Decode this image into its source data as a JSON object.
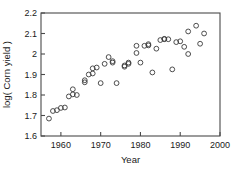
{
  "chart_data": {
    "type": "scatter",
    "title": "",
    "xlabel": "Year",
    "ylabel": "log( Corn yield )",
    "xlim": [
      1955,
      2000
    ],
    "ylim": [
      1.6,
      2.2
    ],
    "xticks": [
      1960,
      1970,
      1980,
      1990,
      2000
    ],
    "xtick_labels": [
      "1960",
      "1970",
      "1980",
      "1990",
      "2000"
    ],
    "yticks": [
      1.6,
      1.7,
      1.8,
      1.9,
      2.0,
      2.1,
      2.2
    ],
    "ytick_labels": [
      "1.6",
      "1.7",
      "1.8",
      "1.9",
      "2",
      "2.1",
      "2.2"
    ],
    "grid": false,
    "legend": null,
    "marker": "open-circle",
    "marker_color": "#3a3a3a",
    "points": [
      {
        "x": 1957,
        "y": 1.685
      },
      {
        "x": 1958,
        "y": 1.722
      },
      {
        "x": 1959,
        "y": 1.726
      },
      {
        "x": 1960,
        "y": 1.737
      },
      {
        "x": 1961,
        "y": 1.739
      },
      {
        "x": 1962,
        "y": 1.793
      },
      {
        "x": 1963,
        "y": 1.803
      },
      {
        "x": 1963,
        "y": 1.828
      },
      {
        "x": 1964,
        "y": 1.8
      },
      {
        "x": 1966,
        "y": 1.862
      },
      {
        "x": 1966,
        "y": 1.872
      },
      {
        "x": 1967,
        "y": 1.9
      },
      {
        "x": 1968,
        "y": 1.905
      },
      {
        "x": 1968,
        "y": 1.93
      },
      {
        "x": 1969,
        "y": 1.934
      },
      {
        "x": 1970,
        "y": 1.858
      },
      {
        "x": 1971,
        "y": 1.952
      },
      {
        "x": 1972,
        "y": 1.985
      },
      {
        "x": 1973,
        "y": 1.958
      },
      {
        "x": 1973,
        "y": 1.965
      },
      {
        "x": 1974,
        "y": 1.858
      },
      {
        "x": 1976,
        "y": 1.938
      },
      {
        "x": 1976,
        "y": 1.944
      },
      {
        "x": 1977,
        "y": 1.952
      },
      {
        "x": 1977,
        "y": 1.958
      },
      {
        "x": 1979,
        "y": 2.005
      },
      {
        "x": 1979,
        "y": 2.04
      },
      {
        "x": 1980,
        "y": 1.958
      },
      {
        "x": 1981,
        "y": 2.04
      },
      {
        "x": 1982,
        "y": 2.042
      },
      {
        "x": 1982,
        "y": 2.048
      },
      {
        "x": 1983,
        "y": 1.91
      },
      {
        "x": 1984,
        "y": 2.026
      },
      {
        "x": 1985,
        "y": 2.068
      },
      {
        "x": 1986,
        "y": 2.072
      },
      {
        "x": 1986,
        "y": 2.074
      },
      {
        "x": 1987,
        "y": 2.072
      },
      {
        "x": 1988,
        "y": 1.925
      },
      {
        "x": 1989,
        "y": 2.058
      },
      {
        "x": 1990,
        "y": 2.062
      },
      {
        "x": 1991,
        "y": 2.035
      },
      {
        "x": 1992,
        "y": 2.11
      },
      {
        "x": 1992,
        "y": 2.0
      },
      {
        "x": 1994,
        "y": 2.138
      },
      {
        "x": 1995,
        "y": 2.05
      },
      {
        "x": 1996,
        "y": 2.1
      }
    ]
  }
}
